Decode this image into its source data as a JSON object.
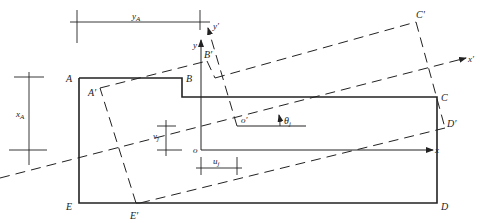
{
  "diagram": {
    "type": "geometry-rotation-diagram",
    "colors": {
      "line": "#222222",
      "background": "#ffffff"
    },
    "original_shape": {
      "vertices": [
        "A",
        "B",
        "C",
        "D",
        "E"
      ],
      "style": "solid"
    },
    "rotated_shape": {
      "vertices": [
        "A'",
        "B'",
        "C'",
        "D'",
        "E'"
      ],
      "style": "dashed"
    },
    "labels": {
      "A": "A",
      "B": "B",
      "C": "C",
      "D": "D",
      "E": "E",
      "A_prime": "A′",
      "B_prime": "B′",
      "C_prime": "C′",
      "D_prime": "D′",
      "E_prime": "E′",
      "origin": "o",
      "origin_prime": "o′",
      "x_axis": "x",
      "y_axis": "y",
      "x_prime_axis": "x′",
      "y_prime_axis": "y′",
      "theta": "θ",
      "theta_sub": "j",
      "yA": "y",
      "yA_sub": "A",
      "xA": "x",
      "xA_sub": "A",
      "vj": "v",
      "vj_sub": "j",
      "uj": "u",
      "uj_sub": "j"
    }
  }
}
